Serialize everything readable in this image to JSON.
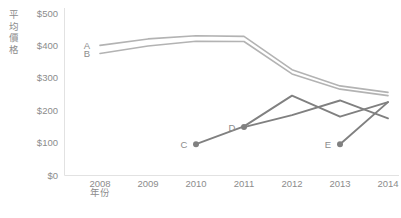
{
  "chart_data": {
    "type": "line",
    "title": "",
    "xlabel": "年份",
    "ylabel": "平均價格",
    "x": [
      2008,
      2009,
      2010,
      2011,
      2012,
      2013,
      2014
    ],
    "xtick_labels": [
      "2008",
      "2009",
      "2010",
      "2011",
      "2012",
      "2013",
      "2014"
    ],
    "ytick_labels": [
      "$500",
      "$400",
      "$300",
      "$200",
      "$100",
      "$0"
    ],
    "ytick_values": [
      500,
      400,
      300,
      200,
      100,
      0
    ],
    "ylim": [
      0,
      500
    ],
    "xlim": [
      2008,
      2014
    ],
    "grid": false,
    "legend": "inline-series-labels",
    "series": [
      {
        "name": "A",
        "label": "A",
        "color": "#b3b3b3",
        "x": [
          2008,
          2009,
          2010,
          2011,
          2012,
          2013,
          2014
        ],
        "values": [
          400,
          420,
          430,
          428,
          325,
          275,
          255
        ],
        "label_x": 2008,
        "label_y": 400,
        "markers": false
      },
      {
        "name": "B",
        "label": "B",
        "color": "#b3b3b3",
        "x": [
          2008,
          2009,
          2010,
          2011,
          2012,
          2013,
          2014
        ],
        "values": [
          375,
          398,
          413,
          412,
          312,
          265,
          245
        ],
        "label_x": 2008,
        "label_y": 375,
        "markers": false
      },
      {
        "name": "C",
        "label": "C",
        "color": "#808080",
        "x": [
          2010,
          2011,
          2012,
          2013,
          2014
        ],
        "values": [
          95,
          150,
          245,
          180,
          225
        ],
        "label_x": 2010,
        "label_y": 95,
        "markers": true
      },
      {
        "name": "D",
        "label": "D",
        "color": "#808080",
        "x": [
          2011,
          2012,
          2013,
          2014
        ],
        "values": [
          148,
          185,
          230,
          175
        ],
        "label_x": 2011,
        "label_y": 148,
        "markers": true
      },
      {
        "name": "E",
        "label": "E",
        "color": "#808080",
        "x": [
          2013,
          2014
        ],
        "values": [
          95,
          225
        ],
        "label_x": 2013,
        "label_y": 95,
        "markers": true
      }
    ],
    "colors": {
      "light_series": "#b3b3b3",
      "dark_series": "#808080",
      "axis": "#e2e2e2",
      "text": "#8c8c8c",
      "background": "#ffffff"
    }
  }
}
